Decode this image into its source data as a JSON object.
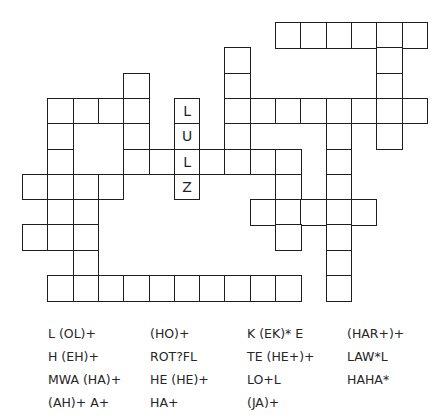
{
  "puzzle": {
    "cell_size": 25.3,
    "origin": {
      "x": 22,
      "y": 22
    },
    "cells": [
      {
        "r": 0,
        "c": 10
      },
      {
        "r": 0,
        "c": 11
      },
      {
        "r": 0,
        "c": 12
      },
      {
        "r": 0,
        "c": 13
      },
      {
        "r": 0,
        "c": 14
      },
      {
        "r": 0,
        "c": 15
      },
      {
        "r": 1,
        "c": 8
      },
      {
        "r": 1,
        "c": 14
      },
      {
        "r": 2,
        "c": 4
      },
      {
        "r": 2,
        "c": 8
      },
      {
        "r": 2,
        "c": 14
      },
      {
        "r": 3,
        "c": 1
      },
      {
        "r": 3,
        "c": 2
      },
      {
        "r": 3,
        "c": 3
      },
      {
        "r": 3,
        "c": 4
      },
      {
        "r": 3,
        "c": 6,
        "letter": "L"
      },
      {
        "r": 3,
        "c": 8
      },
      {
        "r": 3,
        "c": 9
      },
      {
        "r": 3,
        "c": 10
      },
      {
        "r": 3,
        "c": 11
      },
      {
        "r": 3,
        "c": 12
      },
      {
        "r": 3,
        "c": 13
      },
      {
        "r": 3,
        "c": 14
      },
      {
        "r": 3,
        "c": 15
      },
      {
        "r": 4,
        "c": 1
      },
      {
        "r": 4,
        "c": 4
      },
      {
        "r": 4,
        "c": 6,
        "letter": "U"
      },
      {
        "r": 4,
        "c": 8
      },
      {
        "r": 4,
        "c": 12
      },
      {
        "r": 4,
        "c": 14
      },
      {
        "r": 5,
        "c": 1
      },
      {
        "r": 5,
        "c": 4
      },
      {
        "r": 5,
        "c": 5
      },
      {
        "r": 5,
        "c": 6,
        "letter": "L"
      },
      {
        "r": 5,
        "c": 7
      },
      {
        "r": 5,
        "c": 8
      },
      {
        "r": 5,
        "c": 9
      },
      {
        "r": 5,
        "c": 10
      },
      {
        "r": 5,
        "c": 12
      },
      {
        "r": 6,
        "c": 0
      },
      {
        "r": 6,
        "c": 1
      },
      {
        "r": 6,
        "c": 2
      },
      {
        "r": 6,
        "c": 3
      },
      {
        "r": 6,
        "c": 6,
        "letter": "Z"
      },
      {
        "r": 6,
        "c": 10
      },
      {
        "r": 6,
        "c": 12
      },
      {
        "r": 7,
        "c": 1
      },
      {
        "r": 7,
        "c": 2
      },
      {
        "r": 7,
        "c": 9
      },
      {
        "r": 7,
        "c": 10
      },
      {
        "r": 7,
        "c": 11
      },
      {
        "r": 7,
        "c": 12
      },
      {
        "r": 7,
        "c": 13
      },
      {
        "r": 8,
        "c": 0
      },
      {
        "r": 8,
        "c": 1
      },
      {
        "r": 8,
        "c": 2
      },
      {
        "r": 8,
        "c": 10
      },
      {
        "r": 8,
        "c": 12
      },
      {
        "r": 9,
        "c": 2
      },
      {
        "r": 9,
        "c": 12
      },
      {
        "r": 10,
        "c": 1
      },
      {
        "r": 10,
        "c": 2
      },
      {
        "r": 10,
        "c": 3
      },
      {
        "r": 10,
        "c": 4
      },
      {
        "r": 10,
        "c": 5
      },
      {
        "r": 10,
        "c": 6
      },
      {
        "r": 10,
        "c": 7
      },
      {
        "r": 10,
        "c": 8
      },
      {
        "r": 10,
        "c": 9
      },
      {
        "r": 10,
        "c": 10
      },
      {
        "r": 10,
        "c": 12
      }
    ],
    "given_word": "LULZ"
  },
  "clues": {
    "columns": [
      {
        "x": 48,
        "items": [
          "L (OL)+",
          "H (EH)+",
          "MWA (HA)+",
          "(AH)+ A+"
        ]
      },
      {
        "x": 150,
        "items": [
          "(HO)+",
          "ROT?FL",
          "HE (HE)+",
          "HA+"
        ]
      },
      {
        "x": 247,
        "items": [
          "K (EK)* E",
          "TE (HE+)+",
          "LO+L",
          "(JA)+"
        ]
      },
      {
        "x": 347,
        "items": [
          "(HAR+)+",
          "LAW*L",
          "HAHA*"
        ]
      }
    ]
  },
  "colors": {
    "grid_line": "#1f1f1f",
    "text": "#262626",
    "background": "#ffffff"
  }
}
